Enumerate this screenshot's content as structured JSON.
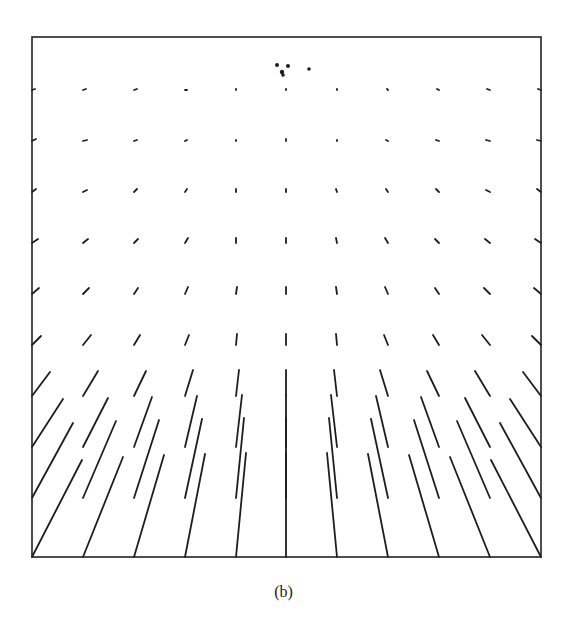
{
  "figure": {
    "caption": "(b)",
    "frame": {
      "left": 32,
      "top": 37,
      "right": 541,
      "bottom": 557,
      "stroke": "#222222",
      "stroke_width": 1.6
    },
    "line_color": "#1e1e1e",
    "focus_dots": [
      {
        "x": 277,
        "y": 65,
        "r": 2.0
      },
      {
        "x": 288,
        "y": 66,
        "r": 2.0
      },
      {
        "x": 282,
        "y": 72,
        "r": 2.2
      },
      {
        "x": 283,
        "y": 75,
        "r": 1.8
      },
      {
        "x": 309,
        "y": 69,
        "r": 1.8
      }
    ],
    "columns_x": [
      32,
      83,
      134,
      185,
      236,
      286,
      337,
      388,
      439,
      490,
      541
    ],
    "rows": [
      {
        "y": 90,
        "vectors": [
          [
            3,
            -1
          ],
          [
            3,
            -1
          ],
          [
            3,
            -1
          ],
          [
            2,
            0
          ],
          [
            0,
            -1
          ],
          [
            0,
            -1
          ],
          [
            0,
            -1
          ],
          [
            -1,
            -1
          ],
          [
            -2,
            -1
          ],
          [
            -3,
            -1
          ],
          [
            -3,
            -1
          ]
        ]
      },
      {
        "y": 141,
        "vectors": [
          [
            4,
            -2
          ],
          [
            4,
            -1
          ],
          [
            3,
            -1
          ],
          [
            2,
            -1
          ],
          [
            0,
            -1
          ],
          [
            0,
            -2
          ],
          [
            0,
            -1
          ],
          [
            -2,
            -1
          ],
          [
            -3,
            -1
          ],
          [
            -4,
            -1
          ],
          [
            -4,
            -1
          ]
        ]
      },
      {
        "y": 192,
        "vectors": [
          [
            4,
            -3
          ],
          [
            4,
            -2
          ],
          [
            3,
            -3
          ],
          [
            2,
            -3
          ],
          [
            0,
            -3
          ],
          [
            0,
            -3
          ],
          [
            -1,
            -3
          ],
          [
            -2,
            -3
          ],
          [
            -3,
            -3
          ],
          [
            -4,
            -2
          ],
          [
            -4,
            -3
          ]
        ]
      },
      {
        "y": 243,
        "vectors": [
          [
            6,
            -4
          ],
          [
            5,
            -4
          ],
          [
            4,
            -4
          ],
          [
            3,
            -5
          ],
          [
            0,
            -5
          ],
          [
            0,
            -5
          ],
          [
            -1,
            -5
          ],
          [
            -3,
            -5
          ],
          [
            -4,
            -4
          ],
          [
            -5,
            -4
          ],
          [
            -6,
            -4
          ]
        ]
      },
      {
        "y": 294,
        "vectors": [
          [
            7,
            -6
          ],
          [
            6,
            -6
          ],
          [
            4,
            -6
          ],
          [
            3,
            -7
          ],
          [
            1,
            -7
          ],
          [
            0,
            -7
          ],
          [
            -1,
            -7
          ],
          [
            -3,
            -7
          ],
          [
            -4,
            -6
          ],
          [
            -6,
            -6
          ],
          [
            -7,
            -6
          ]
        ]
      },
      {
        "y": 345,
        "vectors": [
          [
            9,
            -9
          ],
          [
            8,
            -10
          ],
          [
            6,
            -10
          ],
          [
            4,
            -10
          ],
          [
            1,
            -11
          ],
          [
            0,
            -11
          ],
          [
            -1,
            -11
          ],
          [
            -4,
            -10
          ],
          [
            -6,
            -10
          ],
          [
            -8,
            -10
          ],
          [
            -9,
            -9
          ]
        ]
      },
      {
        "y": 396,
        "vectors": [
          [
            18,
            -24
          ],
          [
            15,
            -25
          ],
          [
            12,
            -25
          ],
          [
            8,
            -26
          ],
          [
            3,
            -26
          ],
          [
            0,
            -26
          ],
          [
            -3,
            -26
          ],
          [
            -8,
            -26
          ],
          [
            -12,
            -25
          ],
          [
            -15,
            -25
          ],
          [
            -18,
            -24
          ]
        ]
      },
      {
        "y": 447,
        "vectors": [
          [
            31,
            -48
          ],
          [
            25,
            -49
          ],
          [
            18,
            -50
          ],
          [
            12,
            -51
          ],
          [
            6,
            -52
          ],
          [
            0,
            -52
          ],
          [
            -6,
            -52
          ],
          [
            -12,
            -51
          ],
          [
            -18,
            -50
          ],
          [
            -25,
            -49
          ],
          [
            -31,
            -48
          ]
        ]
      },
      {
        "y": 498,
        "vectors": [
          [
            41,
            -75
          ],
          [
            33,
            -77
          ],
          [
            25,
            -78
          ],
          [
            17,
            -79
          ],
          [
            8,
            -80
          ],
          [
            0,
            -80
          ],
          [
            -8,
            -80
          ],
          [
            -17,
            -79
          ],
          [
            -25,
            -78
          ],
          [
            -33,
            -77
          ],
          [
            -41,
            -75
          ]
        ]
      },
      {
        "y": 557,
        "vectors": [
          [
            50,
            -97
          ],
          [
            40,
            -100
          ],
          [
            30,
            -102
          ],
          [
            20,
            -103
          ],
          [
            10,
            -104
          ],
          [
            0,
            -104
          ],
          [
            -10,
            -104
          ],
          [
            -20,
            -103
          ],
          [
            -30,
            -102
          ],
          [
            -40,
            -100
          ],
          [
            -50,
            -97
          ]
        ]
      }
    ]
  }
}
